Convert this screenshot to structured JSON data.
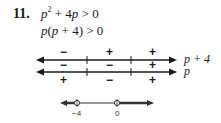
{
  "problem": {
    "number": "11.",
    "line1": {
      "pre": "p",
      "exp": "2",
      "post": " + 4",
      "var": "p",
      "rel": " > 0"
    },
    "line2": {
      "text_a": "p",
      "text_b": "(",
      "text_c": "p",
      "text_d": " + 4) > 0"
    }
  },
  "sign_chart": {
    "critical_points": [
      -4,
      0
    ],
    "rows": [
      {
        "factor": "p + 4",
        "signs_above": [
          "−",
          "+",
          "+"
        ]
      },
      {
        "factor": "p",
        "signs_between": [
          "−",
          "−",
          "+"
        ],
        "signs_below": [
          "+",
          "−",
          "+"
        ]
      }
    ]
  },
  "solution_line": {
    "ticks": [
      "−4",
      "0"
    ],
    "open_points": [
      -4,
      0
    ],
    "shaded": "outward"
  }
}
